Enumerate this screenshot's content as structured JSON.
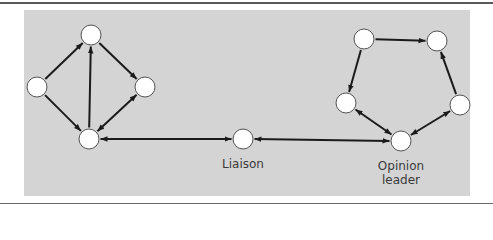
{
  "figure": {
    "background_color": "#d4d4d4",
    "edge_color": "#1a1a1a",
    "node_fill": "#ffffff",
    "node_stroke": "#555555"
  },
  "nodes": [
    {
      "id": "a_top",
      "x": 91,
      "y": 35
    },
    {
      "id": "a_left",
      "x": 37,
      "y": 87
    },
    {
      "id": "a_right",
      "x": 145,
      "y": 87
    },
    {
      "id": "a_bottom",
      "x": 89,
      "y": 139
    },
    {
      "id": "liaison",
      "x": 243,
      "y": 139,
      "label": "Liaison"
    },
    {
      "id": "b_topleft",
      "x": 364,
      "y": 39
    },
    {
      "id": "b_topright",
      "x": 437,
      "y": 41
    },
    {
      "id": "b_midleft",
      "x": 346,
      "y": 103
    },
    {
      "id": "b_midright",
      "x": 460,
      "y": 105
    },
    {
      "id": "opinion_leader",
      "x": 401,
      "y": 141,
      "label": "Opinion leader"
    }
  ],
  "edges": [
    {
      "from": "a_left",
      "to": "a_top",
      "direction": "forward"
    },
    {
      "from": "a_top",
      "to": "a_right",
      "direction": "forward"
    },
    {
      "from": "a_left",
      "to": "a_bottom",
      "direction": "forward"
    },
    {
      "from": "a_bottom",
      "to": "a_top",
      "direction": "forward"
    },
    {
      "from": "a_bottom",
      "to": "a_right",
      "direction": "both"
    },
    {
      "from": "a_bottom",
      "to": "liaison",
      "direction": "both"
    },
    {
      "from": "liaison",
      "to": "opinion_leader",
      "direction": "both"
    },
    {
      "from": "b_topleft",
      "to": "b_topright",
      "direction": "forward"
    },
    {
      "from": "b_topleft",
      "to": "b_midleft",
      "direction": "forward"
    },
    {
      "from": "b_midright",
      "to": "b_topright",
      "direction": "forward"
    },
    {
      "from": "b_midleft",
      "to": "opinion_leader",
      "direction": "both"
    },
    {
      "from": "b_midright",
      "to": "opinion_leader",
      "direction": "both"
    }
  ],
  "labels": {
    "liaison": "Liaison",
    "opinion_leader_line1": "Opinion",
    "opinion_leader_line2": "leader"
  }
}
